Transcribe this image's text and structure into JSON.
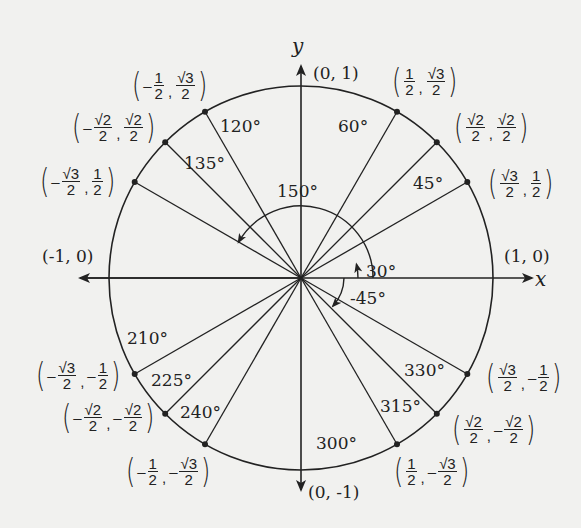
{
  "diagram": {
    "axes": {
      "x_label": "x",
      "y_label": "y"
    },
    "axis_points": [
      {
        "id": "pos-x",
        "label": "(1, 0)"
      },
      {
        "id": "pos-y",
        "label": "(0, 1)"
      },
      {
        "id": "neg-x",
        "label": "(-1, 0)"
      },
      {
        "id": "neg-y",
        "label": "(0, -1)"
      }
    ],
    "angle_labels": {
      "a30": "30°",
      "a45": "45°",
      "a60": "60°",
      "a120": "120°",
      "a135": "135°",
      "a150": "150°",
      "a210": "210°",
      "a225": "225°",
      "a240": "240°",
      "a300": "300°",
      "a315": "315°",
      "a330": "330°",
      "aneg45": "-45°"
    },
    "points": [
      {
        "angle": 30,
        "x": "√3/2",
        "y": "1/2"
      },
      {
        "angle": 45,
        "x": "√2/2",
        "y": "√2/2"
      },
      {
        "angle": 60,
        "x": "1/2",
        "y": "√3/2"
      },
      {
        "angle": 120,
        "x": "-1/2",
        "y": "√3/2"
      },
      {
        "angle": 135,
        "x": "-√2/2",
        "y": "√2/2"
      },
      {
        "angle": 150,
        "x": "-√3/2",
        "y": "1/2"
      },
      {
        "angle": 210,
        "x": "-√3/2",
        "y": "-1/2"
      },
      {
        "angle": 225,
        "x": "-√2/2",
        "y": "-√2/2"
      },
      {
        "angle": 240,
        "x": "-1/2",
        "y": "-√3/2"
      },
      {
        "angle": 300,
        "x": "1/2",
        "y": "-√3/2"
      },
      {
        "angle": 315,
        "x": "√2/2",
        "y": "-√2/2"
      },
      {
        "angle": 330,
        "x": "√3/2",
        "y": "-1/2"
      }
    ],
    "frac": {
      "one": "1",
      "two": "2",
      "r2": "√2",
      "r3": "√3",
      "minus": "–",
      "comma": ","
    },
    "colors": {
      "ink": "#222222",
      "paper": "#f1f1ef"
    }
  }
}
